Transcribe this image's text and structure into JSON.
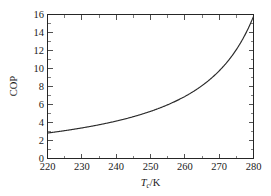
{
  "figure": {
    "background_color": "#ffffff",
    "axis_color": "#262626",
    "curve_color": "#2b2b2b"
  },
  "axis": {
    "x_title_symbol": "T",
    "x_title_subscript": "c",
    "x_title_unit": "/K",
    "y_title": "COP"
  },
  "chart_data": {
    "type": "line",
    "title": "",
    "xlabel": "T_c/K",
    "ylabel": "COP",
    "xlim": [
      220,
      280
    ],
    "ylim": [
      0,
      16
    ],
    "xticks": [
      220,
      230,
      240,
      250,
      260,
      270,
      280
    ],
    "xticklabels": [
      "220",
      "230",
      "240",
      "250",
      "260",
      "270",
      "280"
    ],
    "yticks": [
      0,
      2,
      4,
      6,
      8,
      10,
      12,
      14,
      16
    ],
    "yticklabels": [
      "0",
      "2",
      "4",
      "6",
      "8",
      "10",
      "12",
      "14",
      "16"
    ],
    "grid": false,
    "legend": null,
    "tick_direction": "in",
    "box": true,
    "series": [
      {
        "name": "Carnot COP",
        "x": [
          220,
          222,
          224,
          226,
          228,
          230,
          232,
          234,
          236,
          238,
          240,
          242,
          244,
          246,
          248,
          250,
          252,
          254,
          256,
          258,
          260,
          262,
          264,
          266,
          268,
          270,
          272,
          274,
          276,
          278,
          280
        ],
        "values": [
          2.83,
          2.93,
          3.04,
          3.16,
          3.29,
          3.43,
          3.57,
          3.74,
          3.91,
          4.1,
          4.3,
          4.53,
          4.78,
          5.05,
          5.35,
          5.68,
          6.05,
          6.47,
          6.94,
          7.48,
          8.09,
          8.81,
          9.65,
          10.63,
          11.81,
          13.25,
          15.03,
          17.28,
          20.15,
          24.0,
          15.8
        ]
      }
    ]
  }
}
